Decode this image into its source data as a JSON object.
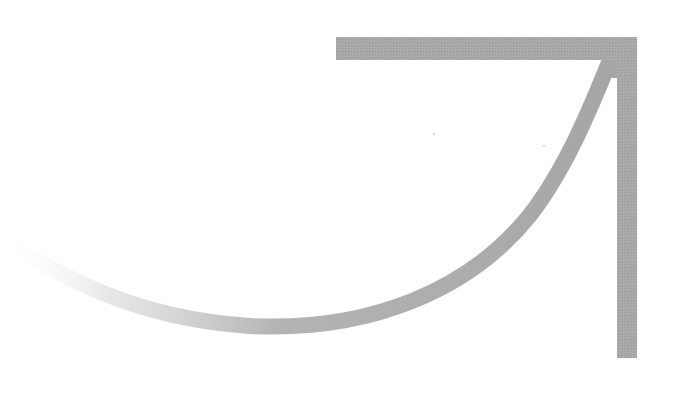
{
  "diagram": {
    "type": "curved-arrow",
    "direction": "up-right",
    "colors": {
      "background": "#ffffff",
      "arrow": "#a6a6a6",
      "fade_start": "#ffffff"
    },
    "arrowhead": {
      "shape": "corner-chevron",
      "corner": [
        627,
        47
      ],
      "horizontal_arm_end": [
        336,
        47
      ],
      "vertical_arm_end": [
        627,
        357
      ],
      "thickness": 21
    },
    "shaft": {
      "shape": "swoosh-curve",
      "start": [
        0,
        240
      ],
      "lowest_point": [
        250,
        325
      ],
      "end": [
        612,
        55
      ],
      "thickness": 16,
      "gradient": "fades-in-from-left"
    }
  }
}
